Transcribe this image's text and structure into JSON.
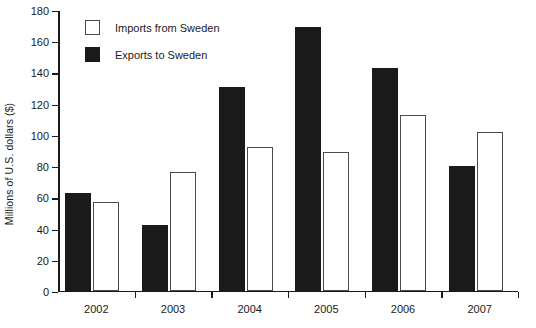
{
  "chart_data": {
    "type": "bar",
    "title": "",
    "xlabel": "",
    "ylabel": "Millions of U.S. dollars ($)",
    "categories": [
      "2002",
      "2003",
      "2004",
      "2005",
      "2006",
      "2007"
    ],
    "series": [
      {
        "name": "Exports to Sweden",
        "color": "#1a1a1a",
        "fill": "solid-black",
        "values": [
          63,
          42,
          131,
          169,
          143,
          80
        ]
      },
      {
        "name": "Imports from Sweden",
        "color": "#ffffff",
        "fill": "open-white",
        "values": [
          57,
          76,
          92,
          89,
          113,
          102
        ]
      }
    ],
    "ylim": [
      0,
      180
    ],
    "ytick_step": 20,
    "yticks": [
      0,
      20,
      40,
      60,
      80,
      100,
      120,
      140,
      160,
      180
    ],
    "grid": false,
    "legend_position": "top-left",
    "series_draw_order": [
      "Exports to Sweden",
      "Imports from Sweden"
    ]
  },
  "legend": {
    "items": [
      {
        "label": "Imports from Sweden",
        "swatch": "open-white-square"
      },
      {
        "label": "Exports to Sweden",
        "swatch": "solid-black-square"
      }
    ]
  }
}
